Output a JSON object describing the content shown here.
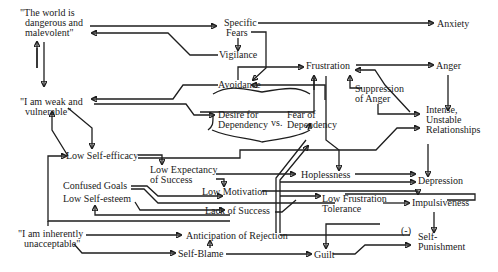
{
  "diagram": {
    "nodes": {
      "world_dangerous": {
        "lines": [
          "\"The world is",
          "dangerous and",
          "malevolent\""
        ]
      },
      "specific_fears": {
        "lines": [
          "Specific",
          "Fears"
        ]
      },
      "anxiety": {
        "lines": [
          "Anxiety"
        ]
      },
      "vigilance": {
        "lines": [
          "Vigilance"
        ]
      },
      "frustration": {
        "lines": [
          "Frustration"
        ]
      },
      "anger": {
        "lines": [
          "Anger"
        ]
      },
      "avoidance": {
        "lines": [
          "Avoidance"
        ]
      },
      "suppression_of_anger": {
        "lines": [
          "Suppression",
          "of Anger"
        ]
      },
      "weak_vulnerable": {
        "lines": [
          "\"I am weak and",
          "vulnerable\""
        ]
      },
      "desire_for_dependency": {
        "lines": [
          "Desire for",
          "Dependency"
        ]
      },
      "vs": {
        "lines": [
          "vs."
        ]
      },
      "fear_of_dependency": {
        "lines": [
          "Fear of",
          "Dependency"
        ]
      },
      "intense_unstable": {
        "lines": [
          "Intense,",
          "Unstable",
          "Relationships"
        ]
      },
      "low_self_efficacy": {
        "lines": [
          "Low Self-efficacy"
        ]
      },
      "low_expectancy": {
        "lines": [
          "Low Expectancy",
          "of Success"
        ]
      },
      "hopelessness": {
        "lines": [
          "Hoplessness"
        ]
      },
      "depression": {
        "lines": [
          "Depression"
        ]
      },
      "confused_goals": {
        "lines": [
          "Confused Goals"
        ]
      },
      "low_motivation": {
        "lines": [
          "Low Motivation"
        ]
      },
      "low_frustration_tolerance": {
        "lines": [
          "Low Frustration",
          "Tolerance"
        ]
      },
      "impulsiveness": {
        "lines": [
          "Impulsiveness"
        ]
      },
      "low_self_esteem": {
        "lines": [
          "Low Self-esteem"
        ]
      },
      "lack_of_success": {
        "lines": [
          "Lack of Success"
        ]
      },
      "inherently_unacceptable": {
        "lines": [
          "\"I am inherently",
          "unacceptable\""
        ]
      },
      "anticipation_of_rejection": {
        "lines": [
          "Anticipation of Rejection"
        ]
      },
      "negative_sign": {
        "lines": [
          "(-)"
        ]
      },
      "self_punishment": {
        "lines": [
          "Self-",
          "Punishment"
        ]
      },
      "self_blame": {
        "lines": [
          "Self-Blame"
        ]
      },
      "guilt": {
        "lines": [
          "Guilt"
        ]
      }
    },
    "edges": [
      {
        "from": "world_dangerous",
        "to": "specific_fears"
      },
      {
        "from": "vigilance",
        "to": "world_dangerous"
      },
      {
        "from": "world_dangerous",
        "to": "weak_vulnerable"
      },
      {
        "from": "weak_vulnerable",
        "to": "world_dangerous"
      },
      {
        "from": "specific_fears",
        "to": "anxiety"
      },
      {
        "from": "specific_fears",
        "to": "vigilance"
      },
      {
        "from": "specific_fears",
        "to": "avoidance"
      },
      {
        "from": "avoidance",
        "to": "frustration"
      },
      {
        "from": "avoidance",
        "to": "weak_vulnerable"
      },
      {
        "from": "fear_of_dependency",
        "to": "avoidance"
      },
      {
        "from": "weak_vulnerable",
        "to": "desire_for_dependency"
      },
      {
        "from": "desire_for_dependency",
        "to": "frustration"
      },
      {
        "from": "frustration",
        "to": "anger"
      },
      {
        "from": "frustration",
        "to": "hopelessness"
      },
      {
        "from": "suppression_of_anger",
        "to": "frustration"
      },
      {
        "from": "anger",
        "to": "intense_unstable"
      },
      {
        "from": "intense_unstable",
        "to": "frustration"
      },
      {
        "from": "suppression_of_anger",
        "to": "intense_unstable"
      },
      {
        "from": "low_self_efficacy",
        "to": "intense_unstable"
      },
      {
        "from": "intense_unstable",
        "to": "depression"
      },
      {
        "from": "weak_vulnerable",
        "to": "low_self_efficacy"
      },
      {
        "from": "low_self_efficacy",
        "to": "weak_vulnerable"
      },
      {
        "from": "low_self_efficacy",
        "to": "low_expectancy"
      },
      {
        "from": "low_expectancy",
        "to": "low_motivation"
      },
      {
        "from": "low_expectancy",
        "to": "hopelessness"
      },
      {
        "from": "hopelessness",
        "to": "depression"
      },
      {
        "from": "confused_goals",
        "to": "low_motivation"
      },
      {
        "from": "confused_goals",
        "to": "lack_of_success"
      },
      {
        "from": "low_self_esteem",
        "to": "lack_of_success"
      },
      {
        "from": "lack_of_success",
        "to": "low_self_esteem"
      },
      {
        "from": "lack_of_success",
        "to": "low_self_efficacy"
      },
      {
        "from": "low_motivation",
        "to": "low_frustration_tolerance"
      },
      {
        "from": "lack_of_success",
        "to": "depression"
      },
      {
        "from": "anticipation_of_rejection",
        "to": "fear_of_dependency"
      },
      {
        "from": "lack_of_success",
        "to": "suppression_of_anger"
      },
      {
        "from": "low_frustration_tolerance",
        "to": "impulsiveness"
      },
      {
        "from": "low_frustration_tolerance",
        "to": "depression"
      },
      {
        "from": "impulsiveness",
        "to": "self_punishment"
      },
      {
        "from": "inherently_unacceptable",
        "to": "anticipation_of_rejection"
      },
      {
        "from": "inherently_unacceptable",
        "to": "self_blame"
      },
      {
        "from": "self_blame",
        "to": "anticipation_of_rejection"
      },
      {
        "from": "self_blame",
        "to": "guilt"
      },
      {
        "from": "frustration",
        "to": "guilt"
      },
      {
        "from": "guilt",
        "to": "self_punishment"
      },
      {
        "from": "low_self_esteem",
        "to": "self_punishment",
        "label": "(-)"
      }
    ]
  }
}
